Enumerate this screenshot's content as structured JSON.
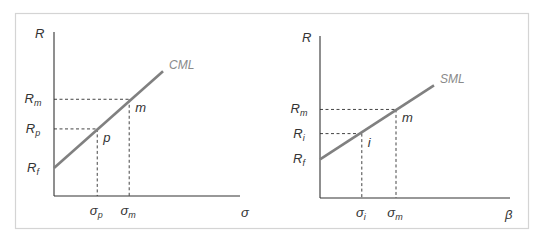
{
  "colors": {
    "frame": "#d4d4d4",
    "axis": "#333333",
    "line": "#808080",
    "dash": "#444444",
    "text": "#333333",
    "line_label": "#8a8a8a"
  },
  "chart_data": [
    {
      "type": "line",
      "title": "Capital Market Line",
      "line_label": "CML",
      "ylabel": "R",
      "xlabel": "σ",
      "y_ticks": [
        {
          "label": "R",
          "sub": "m",
          "value": 0.62
        },
        {
          "label": "R",
          "sub": "p",
          "value": 0.43
        },
        {
          "label": "R",
          "sub": "f",
          "value": 0.18
        }
      ],
      "x_ticks": [
        {
          "label": "σ",
          "sub": "p",
          "value": 0.23
        },
        {
          "label": "σ",
          "sub": "m",
          "value": 0.4
        }
      ],
      "points": [
        {
          "label": "p",
          "x": 0.23,
          "y": 0.43
        },
        {
          "label": "m",
          "x": 0.4,
          "y": 0.62
        }
      ],
      "line": {
        "x": [
          0,
          0.58
        ],
        "y": [
          0.18,
          0.8
        ]
      },
      "xlim": [
        0,
        1
      ],
      "ylim": [
        0,
        1
      ]
    },
    {
      "type": "line",
      "title": "Security Market Line",
      "line_label": "SML",
      "ylabel": "R",
      "xlabel": "β",
      "y_ticks": [
        {
          "label": "R",
          "sub": "m",
          "value": 0.55
        },
        {
          "label": "R",
          "sub": "i",
          "value": 0.4
        },
        {
          "label": "R",
          "sub": "f",
          "value": 0.24
        }
      ],
      "x_ticks": [
        {
          "label": "σ",
          "sub": "i",
          "value": 0.22
        },
        {
          "label": "σ",
          "sub": "m",
          "value": 0.4
        }
      ],
      "points": [
        {
          "label": "i",
          "x": 0.22,
          "y": 0.4
        },
        {
          "label": "m",
          "x": 0.4,
          "y": 0.55
        }
      ],
      "line": {
        "x": [
          0,
          0.6
        ],
        "y": [
          0.24,
          0.7
        ]
      },
      "xlim": [
        0,
        1
      ],
      "ylim": [
        0,
        1
      ]
    }
  ]
}
